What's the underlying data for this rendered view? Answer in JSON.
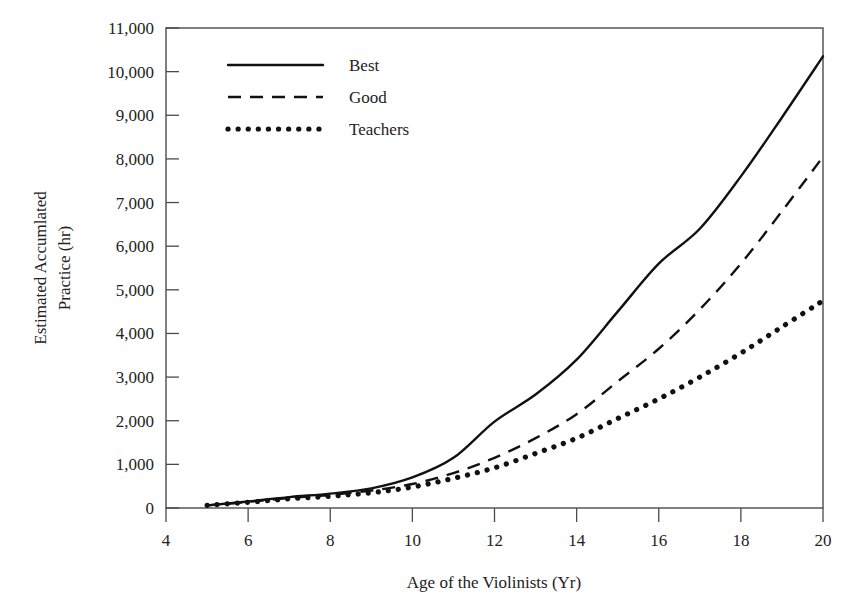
{
  "figure": {
    "title": "",
    "background": "#ffffff",
    "line_color": "#111111",
    "axis_color": "#4a4a4a"
  },
  "axes": {
    "x": {
      "label": "Age of the Violinists (Yr)",
      "ticks": [
        "4",
        "6",
        "8",
        "10",
        "12",
        "14",
        "16",
        "18",
        "20"
      ],
      "min": 4,
      "max": 20
    },
    "y": {
      "label_line1": "Estimated Accumlated",
      "label_line2": "Practice (hr)",
      "ticks": [
        "0",
        "1,000",
        "2,000",
        "3,000",
        "4,000",
        "5,000",
        "6,000",
        "7,000",
        "8,000",
        "9,000",
        "10,000",
        "11,000"
      ],
      "min": 0,
      "max": 11000
    }
  },
  "legend": {
    "position": "top-left-inside",
    "entries": [
      {
        "label": "Best",
        "style": "solid"
      },
      {
        "label": "Good",
        "style": "dashed"
      },
      {
        "label": "Teachers",
        "style": "dotted"
      }
    ]
  },
  "chart_data": {
    "type": "line",
    "title": "",
    "xlabel": "Age of the Violinists (Yr)",
    "ylabel": "Estimated Accumlated Practice (hr)",
    "xlim": [
      4,
      20
    ],
    "ylim": [
      0,
      11000
    ],
    "xticks": [
      4,
      6,
      8,
      10,
      12,
      14,
      16,
      18,
      20
    ],
    "yticks": [
      0,
      1000,
      2000,
      3000,
      4000,
      5000,
      6000,
      7000,
      8000,
      9000,
      10000,
      11000
    ],
    "grid": false,
    "legend_position": "upper left",
    "x": [
      5,
      6,
      7,
      8,
      9,
      10,
      11,
      12,
      13,
      14,
      15,
      16,
      17,
      18,
      19,
      20
    ],
    "series": [
      {
        "name": "Best",
        "style": "solid",
        "color": "#111111",
        "values": [
          60,
          150,
          250,
          330,
          450,
          700,
          1150,
          1980,
          2600,
          3400,
          4500,
          5600,
          6400,
          7600,
          8950,
          10350
        ]
      },
      {
        "name": "Good",
        "style": "dashed",
        "color": "#111111",
        "values": [
          60,
          140,
          230,
          300,
          400,
          550,
          800,
          1150,
          1600,
          2150,
          2900,
          3650,
          4550,
          5600,
          6800,
          8050
        ]
      },
      {
        "name": "Teachers",
        "style": "dotted",
        "color": "#111111",
        "values": [
          60,
          130,
          210,
          270,
          350,
          480,
          680,
          920,
          1250,
          1600,
          2050,
          2500,
          3000,
          3550,
          4150,
          4750
        ]
      }
    ]
  }
}
